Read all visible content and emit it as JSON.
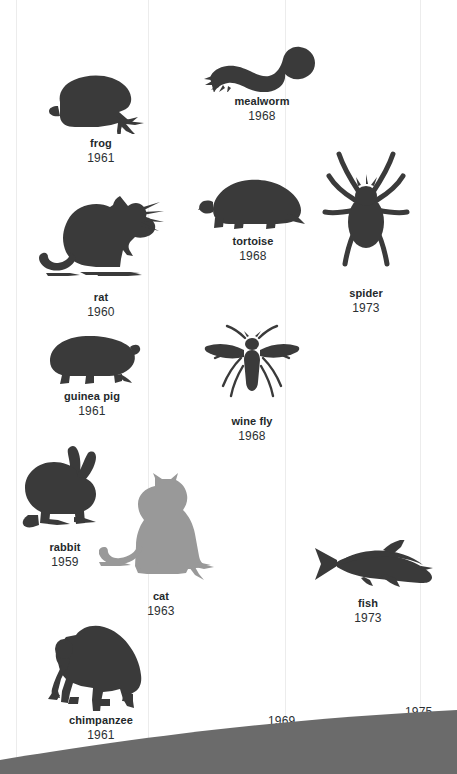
{
  "figure": {
    "type": "timeline-illustration",
    "background_color": "#ffffff",
    "gridline_color": "#ececec",
    "silhouette_color": "#3a3a3a",
    "highlight_silhouette_color": "#999999",
    "ground_color": "#6b6b6b",
    "text_color": "#2b3033"
  },
  "gridlines": [
    {
      "name": "gridline-1",
      "x": 16
    },
    {
      "name": "gridline-2",
      "x": 148
    },
    {
      "name": "gridline-3",
      "x": 285
    },
    {
      "name": "gridline-4",
      "x": 420
    }
  ],
  "animals": [
    {
      "id": "frog",
      "icon": "frog-silhouette-icon",
      "label": "frog",
      "year": "1961",
      "color": "#3a3a3a",
      "x": 46,
      "y": 72,
      "w": 110,
      "h": 62,
      "cap_w": 110
    },
    {
      "id": "mealworm",
      "icon": "mealworm-silhouette-icon",
      "label": "mealworm",
      "year": "1968",
      "color": "#3a3a3a",
      "x": 198,
      "y": 42,
      "w": 128,
      "h": 50,
      "cap_w": 128
    },
    {
      "id": "rat",
      "icon": "rat-silhouette-icon",
      "label": "rat",
      "year": "1960",
      "color": "#3a3a3a",
      "x": 36,
      "y": 192,
      "w": 130,
      "h": 96,
      "cap_w": 130
    },
    {
      "id": "tortoise",
      "icon": "tortoise-silhouette-icon",
      "label": "tortoise",
      "year": "1968",
      "color": "#3a3a3a",
      "x": 197,
      "y": 170,
      "w": 112,
      "h": 62,
      "cap_w": 112
    },
    {
      "id": "spider",
      "icon": "spider-silhouette-icon",
      "label": "spider",
      "year": "1973",
      "color": "#3a3a3a",
      "x": 321,
      "y": 144,
      "w": 90,
      "h": 140,
      "cap_w": 90
    },
    {
      "id": "guinea-pig",
      "icon": "guinea-pig-silhouette-icon",
      "label": "guinea pig",
      "year": "1961",
      "color": "#3a3a3a",
      "x": 42,
      "y": 333,
      "w": 100,
      "h": 54,
      "cap_w": 100
    },
    {
      "id": "wine-fly",
      "icon": "wine-fly-silhouette-icon",
      "label": "wine fly",
      "year": "1968",
      "color": "#3a3a3a",
      "x": 197,
      "y": 322,
      "w": 110,
      "h": 90,
      "cap_w": 110
    },
    {
      "id": "rabbit",
      "icon": "rabbit-silhouette-icon",
      "label": "rabbit",
      "year": "1959",
      "color": "#3a3a3a",
      "x": 16,
      "y": 443,
      "w": 98,
      "h": 95,
      "cap_w": 98
    },
    {
      "id": "cat",
      "icon": "cat-silhouette-icon",
      "label": "cat",
      "year": "1963",
      "color": "#999999",
      "x": 99,
      "y": 472,
      "w": 124,
      "h": 115,
      "cap_w": 124
    },
    {
      "id": "fish",
      "icon": "fish-silhouette-icon",
      "label": "fish",
      "year": "1973",
      "color": "#3a3a3a",
      "x": 301,
      "y": 540,
      "w": 134,
      "h": 54,
      "cap_w": 134
    },
    {
      "id": "chimpanzee",
      "icon": "chimpanzee-silhouette-icon",
      "label": "chimpanzee",
      "year": "1961",
      "color": "#3a3a3a",
      "x": 46,
      "y": 623,
      "w": 110,
      "h": 88,
      "cap_w": 110
    }
  ],
  "axis_years": [
    {
      "id": "axis-year-1963",
      "value": "1963",
      "x": 132,
      "y": 738
    },
    {
      "id": "axis-year-1969",
      "value": "1969",
      "x": 268,
      "y": 714
    },
    {
      "id": "axis-year-1975",
      "value": "1975",
      "x": 405,
      "y": 705
    }
  ]
}
